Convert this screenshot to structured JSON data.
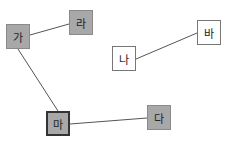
{
  "diagram": {
    "type": "graph",
    "nodes": [
      {
        "id": "ga",
        "label": "가",
        "x": 6,
        "y": 24,
        "style": "gray"
      },
      {
        "id": "ra",
        "label": "라",
        "x": 69,
        "y": 10,
        "style": "gray"
      },
      {
        "id": "ma",
        "label": "마",
        "x": 46,
        "y": 111,
        "style": "gray",
        "selected": true
      },
      {
        "id": "da",
        "label": "다",
        "x": 147,
        "y": 105,
        "style": "gray"
      },
      {
        "id": "na",
        "label": "나",
        "x": 112,
        "y": 46,
        "style": "white"
      },
      {
        "id": "ba",
        "label": "바",
        "x": 197,
        "y": 20,
        "style": "white"
      }
    ],
    "edges": [
      {
        "from": "ga",
        "to": "ra"
      },
      {
        "from": "ga",
        "to": "ma"
      },
      {
        "from": "ma",
        "to": "da"
      },
      {
        "from": "na",
        "to": "ba"
      }
    ],
    "colors": {
      "gray_fill": "#a8a8a8",
      "white_fill": "#ffffff",
      "edge": "#555555"
    }
  }
}
